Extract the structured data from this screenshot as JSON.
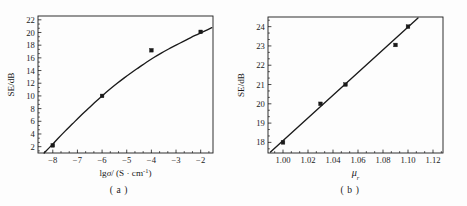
{
  "figure": {
    "panel_count": 2,
    "background_color": "#fdfdfd",
    "ink_color": "#1a1a1a"
  },
  "panel_a": {
    "caption": "( a )",
    "chart_data": {
      "type": "scatter",
      "title": "",
      "xlabel": "lgσ/ (S · cm⁻¹)",
      "xlabel_parts": {
        "prefix": "lg",
        "symbol": "σ",
        "mid": "/ (S · cm",
        "sup": "-1",
        "suffix": ")"
      },
      "ylabel": "SE/dB",
      "xlim": [
        -8.6,
        -1.5
      ],
      "ylim": [
        1.0,
        22.6
      ],
      "xticks": [
        -8,
        -7,
        -6,
        -5,
        -4,
        -3,
        -2
      ],
      "xtick_labels": [
        "−8",
        "−7",
        "−6",
        "−5",
        "−4",
        "−3",
        "−2"
      ],
      "x_minor_per_interval": 2,
      "yticks": [
        2,
        4,
        6,
        8,
        10,
        12,
        14,
        16,
        18,
        20,
        22
      ],
      "ytick_labels": [
        "2",
        "4",
        "6",
        "8",
        "10",
        "12",
        "14",
        "16",
        "18",
        "20",
        "22"
      ],
      "y_minor_per_interval": 2,
      "grid": false,
      "legend": null,
      "series": [
        {
          "name": "measured",
          "marker": "square",
          "x": [
            -8.0,
            -6.0,
            -4.0,
            -2.0
          ],
          "values": [
            2.2,
            10.0,
            17.2,
            20.1
          ]
        },
        {
          "name": "fitted curve",
          "marker": "none",
          "line": true,
          "x": [
            -8.35,
            -8.1,
            -7.8,
            -7.5,
            -7.2,
            -6.9,
            -6.6,
            -6.3,
            -6.0,
            -5.7,
            -5.4,
            -5.1,
            -4.8,
            -4.5,
            -4.2,
            -3.9,
            -3.6,
            -3.3,
            -3.0,
            -2.7,
            -2.4,
            -2.1,
            -1.8,
            -1.55
          ],
          "values": [
            1.0,
            2.0,
            3.25,
            4.45,
            5.6,
            6.75,
            7.85,
            8.95,
            10.0,
            11.0,
            11.95,
            12.85,
            13.7,
            14.5,
            15.3,
            16.05,
            16.75,
            17.4,
            18.0,
            18.6,
            19.2,
            19.75,
            20.3,
            20.75
          ]
        }
      ]
    }
  },
  "panel_b": {
    "caption": "( b )",
    "chart_data": {
      "type": "scatter",
      "title": "",
      "xlabel": "μr",
      "xlabel_parts": {
        "symbol": "μ",
        "sub": "r"
      },
      "ylabel": "SE/dB",
      "xlim": [
        0.988,
        1.128
      ],
      "ylim": [
        17.45,
        24.5
      ],
      "xticks": [
        1.0,
        1.02,
        1.04,
        1.06,
        1.08,
        1.1,
        1.12
      ],
      "xtick_labels": [
        "1.00",
        "1.02",
        "1.04",
        "1.06",
        "1.08",
        "1.10",
        "1.12"
      ],
      "x_minor_per_interval": 2,
      "yticks": [
        18,
        19,
        20,
        21,
        22,
        23,
        24
      ],
      "ytick_labels": [
        "18",
        "19",
        "20",
        "21",
        "22",
        "23",
        "24"
      ],
      "y_minor_per_interval": 2,
      "grid": false,
      "legend": null,
      "series": [
        {
          "name": "measured",
          "marker": "square",
          "x": [
            1.0,
            1.03,
            1.05,
            1.09,
            1.1
          ],
          "values": [
            18.0,
            20.0,
            21.0,
            23.05,
            24.0
          ]
        },
        {
          "name": "linear fit",
          "marker": "none",
          "line": true,
          "x": [
            0.99,
            1.108
          ],
          "values": [
            17.5,
            24.45
          ]
        }
      ]
    }
  }
}
